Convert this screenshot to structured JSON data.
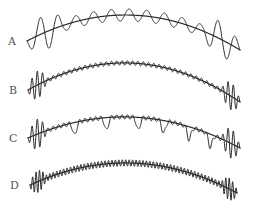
{
  "figure": {
    "background": "#ffffff",
    "stroke_color": "#2a2a2a",
    "label_color": "#555555",
    "traces": [
      {
        "label": "A",
        "label_pos": [
          8,
          36
        ],
        "start": [
          27,
          41
        ],
        "peak": [
          125,
          15
        ],
        "end": [
          240,
          50
        ],
        "cycles": 12,
        "base_amp": 6,
        "edge_amp": 18,
        "edge_width": 0.08,
        "dips": null
      },
      {
        "label": "B",
        "label_pos": [
          9,
          85
        ],
        "start": [
          28,
          90
        ],
        "peak": [
          130,
          63
        ],
        "end": [
          240,
          102
        ],
        "cycles": 40,
        "base_amp": 2.2,
        "edge_amp": 14,
        "edge_width": 0.04,
        "dips": null
      },
      {
        "label": "C",
        "label_pos": [
          9,
          133
        ],
        "start": [
          28,
          138
        ],
        "peak": [
          130,
          117
        ],
        "end": [
          240,
          148
        ],
        "cycles": 40,
        "base_amp": 2.2,
        "edge_amp": 15,
        "edge_width": 0.04,
        "dips": [
          0.22,
          0.37,
          0.52,
          0.64,
          0.76,
          0.86
        ]
      },
      {
        "label": "D",
        "label_pos": [
          10,
          180
        ],
        "start": [
          30,
          185
        ],
        "peak": [
          130,
          163
        ],
        "end": [
          237,
          193
        ],
        "cycles": 60,
        "base_amp": 3.2,
        "edge_amp": 11,
        "edge_width": 0.035,
        "dips": null
      }
    ]
  }
}
